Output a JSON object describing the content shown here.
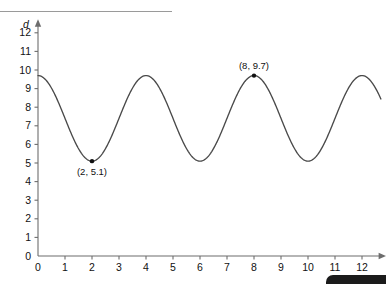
{
  "figure": {
    "background_color": "#ffffff",
    "curve_color": "#4a4a4a",
    "axis_color": "#6d6d6d",
    "marker_color": "#111111"
  },
  "chart_data": {
    "type": "line",
    "title": "",
    "subtitle": "",
    "xlabel": "t",
    "ylabel": "d",
    "xlim": [
      0,
      12.8
    ],
    "ylim": [
      0,
      12.6
    ],
    "xticks": [
      0,
      1,
      2,
      3,
      4,
      5,
      6,
      7,
      8,
      9,
      10,
      11,
      12
    ],
    "xticklabels": [
      "0",
      "1",
      "2",
      "3",
      "4",
      "5",
      "6",
      "7",
      "8",
      "9",
      "10",
      "11",
      "12"
    ],
    "yticks": [
      0,
      1,
      2,
      3,
      4,
      5,
      6,
      7,
      8,
      9,
      10,
      11,
      12
    ],
    "yticklabels": [
      "0",
      "1",
      "2",
      "3",
      "4",
      "5",
      "6",
      "7",
      "8",
      "9",
      "10",
      "11",
      "12"
    ],
    "grid": false,
    "legend": false,
    "function": {
      "midline": 7.4,
      "amplitude": 2.3,
      "period": 4,
      "minimum_value": 5.1,
      "maximum_value": 9.7,
      "start_value": 9.7
    },
    "series": [
      {
        "name": "d",
        "x": [
          0,
          1,
          2,
          3,
          4,
          5,
          6,
          7,
          8,
          9,
          10,
          11,
          12,
          12.7
        ],
        "values": [
          9.7,
          7.4,
          5.1,
          7.4,
          9.7,
          7.4,
          5.1,
          7.4,
          9.7,
          7.4,
          5.1,
          7.4,
          9.7,
          7.6
        ]
      }
    ],
    "annotations": [
      {
        "name": "minimum-point",
        "label": "(2, 5.1)",
        "x": 2,
        "y": 5.1,
        "marker": true,
        "label_position": "below"
      },
      {
        "name": "maximum-point",
        "label": "(8, 9.7)",
        "x": 8,
        "y": 9.7,
        "marker": true,
        "label_position": "above"
      }
    ]
  }
}
